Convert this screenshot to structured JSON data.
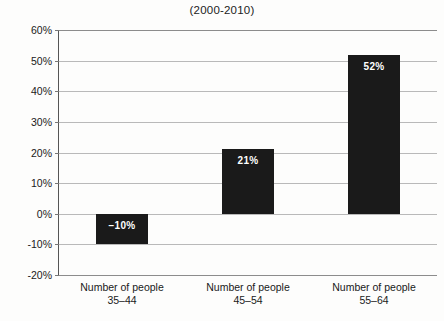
{
  "chart_data": {
    "type": "bar",
    "title": "(2000-2010)",
    "subtitle": "",
    "xlabel": "",
    "ylabel": "",
    "categories": [
      "Number of people 35–44",
      "Number of people 45–54",
      "Number of people 55–64"
    ],
    "category_lines": [
      {
        "line1": "Number of people",
        "line2": "35–44"
      },
      {
        "line1": "Number of people",
        "line2": "45–54"
      },
      {
        "line1": "Number of people",
        "line2": "55–64"
      }
    ],
    "values": [
      -10,
      21,
      52
    ],
    "value_labels": [
      "−10%",
      "21%",
      "52%"
    ],
    "ylim": [
      -20,
      60
    ],
    "ytick_step": 10,
    "ytick_labels": [
      "60%",
      "50%",
      "40%",
      "30%",
      "20%",
      "10%",
      "0%",
      "-10%",
      "-20%"
    ],
    "ytick_values": [
      60,
      50,
      40,
      30,
      20,
      10,
      0,
      -10,
      -20
    ],
    "grid": true,
    "legend": "none",
    "bar_color": "#1a1a1a",
    "gridline_color": "#b9b9b9",
    "axis_color": "#555555",
    "background_color": "#fdfdfc",
    "value_label_color": "#ffffff"
  }
}
